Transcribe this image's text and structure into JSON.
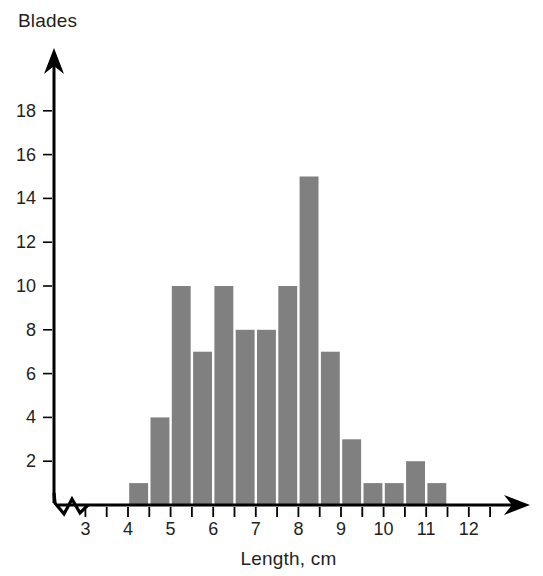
{
  "chart_data": {
    "type": "bar",
    "title": "",
    "subtitle": "",
    "xlabel": "Length, cm",
    "ylabel": "Blades",
    "bin_width": 0.5,
    "bin_starts": [
      4.0,
      4.5,
      5.0,
      5.5,
      6.0,
      6.5,
      7.0,
      7.5,
      8.0,
      8.5,
      9.0,
      9.5,
      10.0,
      10.5,
      11.0
    ],
    "bin_ends": [
      4.5,
      5.0,
      5.5,
      6.0,
      6.5,
      7.0,
      7.5,
      8.0,
      8.5,
      9.0,
      9.5,
      10.0,
      10.5,
      11.0,
      11.5
    ],
    "categories": [
      "4.0-4.5",
      "4.5-5.0",
      "5.0-5.5",
      "5.5-6.0",
      "6.0-6.5",
      "6.5-7.0",
      "7.0-7.5",
      "7.5-8.0",
      "8.0-8.5",
      "8.5-9.0",
      "9.0-9.5",
      "9.5-10.0",
      "10.0-10.5",
      "10.5-11.0",
      "11.0-11.5"
    ],
    "values": [
      1,
      4,
      10,
      7,
      10,
      8,
      8,
      10,
      15,
      7,
      3,
      1,
      1,
      2,
      1
    ],
    "xlim": [
      2.5,
      12.6
    ],
    "ylim": [
      0,
      19.5
    ],
    "x_tick_labels": [
      "3",
      "4",
      "5",
      "6",
      "7",
      "8",
      "9",
      "10",
      "11",
      "12"
    ],
    "x_tick_values": [
      3,
      4,
      5,
      6,
      7,
      8,
      9,
      10,
      11,
      12
    ],
    "x_minor_tick_step": 0.5,
    "y_tick_labels": [
      "2",
      "4",
      "6",
      "8",
      "10",
      "12",
      "14",
      "16",
      "18"
    ],
    "y_tick_values": [
      2,
      4,
      6,
      8,
      10,
      12,
      14,
      16,
      18
    ],
    "grid": false,
    "legend": null,
    "bar_color": "#808080",
    "axis_color": "#000000",
    "axis_break": true,
    "axis_arrows": [
      "x-right",
      "y-up"
    ],
    "total_blades": 89
  },
  "axes": {
    "y_title": "Blades",
    "x_title": "Length, cm"
  }
}
